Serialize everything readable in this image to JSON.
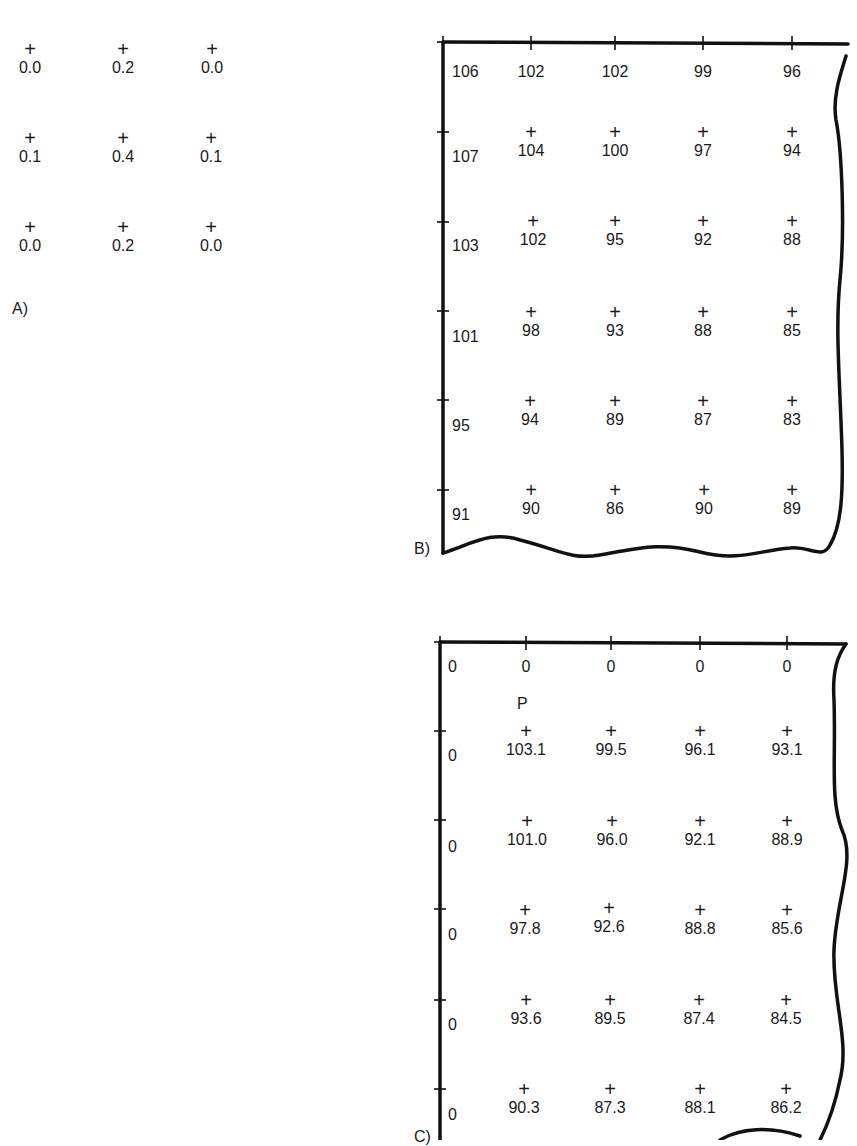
{
  "panel_a": {
    "label": "A)",
    "rows": [
      [
        "0.0",
        "0.2",
        "0.0"
      ],
      [
        "0.1",
        "0.4",
        "0.1"
      ],
      [
        "0.0",
        "0.2",
        "0.0"
      ]
    ]
  },
  "panel_b": {
    "label": "B)",
    "rows": [
      [
        "106",
        "102",
        "102",
        "99",
        "96"
      ],
      [
        "107",
        "104",
        "100",
        "97",
        "94"
      ],
      [
        "103",
        "102",
        "95",
        "92",
        "88"
      ],
      [
        "101",
        "98",
        "93",
        "88",
        "85"
      ],
      [
        "95",
        "94",
        "89",
        "87",
        "83"
      ],
      [
        "91",
        "90",
        "86",
        "90",
        "89"
      ]
    ]
  },
  "panel_c": {
    "label": "C)",
    "point_label": "P",
    "rows": [
      [
        "0",
        "0",
        "0",
        "0",
        "0"
      ],
      [
        "0",
        "103.1",
        "99.5",
        "96.1",
        "93.1"
      ],
      [
        "0",
        "101.0",
        "96.0",
        "92.1",
        "88.9"
      ],
      [
        "0",
        "97.8",
        "92.6",
        "88.8",
        "85.6"
      ],
      [
        "0",
        "93.6",
        "89.5",
        "87.4",
        "84.5"
      ],
      [
        "0",
        "90.3",
        "87.3",
        "88.1",
        "86.2"
      ]
    ]
  },
  "glyphs": {
    "cross": "+"
  }
}
